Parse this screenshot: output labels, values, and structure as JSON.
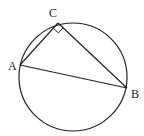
{
  "diagram": {
    "type": "geometry",
    "circle": {
      "cx": 73,
      "cy": 77,
      "r": 54
    },
    "points": {
      "A": {
        "label": "A",
        "x": 20,
        "y": 65,
        "label_x": 8,
        "label_y": 70
      },
      "B": {
        "label": "B",
        "x": 127,
        "y": 88,
        "label_x": 131,
        "label_y": 98
      },
      "C": {
        "label": "C",
        "x": 58,
        "y": 23,
        "label_x": 49,
        "label_y": 17
      }
    },
    "right_angle_at": "C",
    "stroke_color": "#222222"
  }
}
